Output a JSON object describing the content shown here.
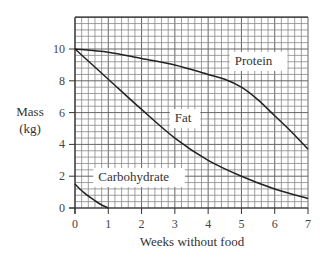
{
  "chart_data": {
    "type": "line",
    "title": "",
    "xlabel": "Weeks without food",
    "ylabel": [
      "Mass",
      "(kg)"
    ],
    "xlim": [
      0,
      7
    ],
    "ylim": [
      0,
      12
    ],
    "x_ticks": [
      0,
      1,
      2,
      3,
      4,
      5,
      6,
      7
    ],
    "y_ticks": [
      0,
      2,
      4,
      6,
      8,
      10
    ],
    "grid": true,
    "grid_minor": {
      "x_step": 0.2,
      "y_step": 0.4
    },
    "series": [
      {
        "name": "Protein",
        "label_pos": [
          4.8,
          9.0
        ],
        "x": [
          0,
          1,
          2,
          3,
          4,
          4.5,
          5,
          5.5,
          6,
          6.5,
          7
        ],
        "values": [
          10,
          9.8,
          9.4,
          9.0,
          8.4,
          8.1,
          7.6,
          6.8,
          5.8,
          4.8,
          3.7
        ]
      },
      {
        "name": "Fat",
        "label_pos": [
          3.0,
          5.4
        ],
        "x": [
          0,
          1,
          2,
          3,
          4,
          5,
          6,
          7
        ],
        "values": [
          10,
          8.1,
          6.2,
          4.4,
          3.0,
          2.0,
          1.2,
          0.6
        ]
      },
      {
        "name": "Carbohydrate",
        "label_pos": [
          0.7,
          1.7
        ],
        "x": [
          0,
          0.25,
          0.5,
          0.75,
          1
        ],
        "values": [
          1.5,
          1.0,
          0.6,
          0.25,
          0
        ]
      }
    ],
    "legend": "inline labels"
  }
}
